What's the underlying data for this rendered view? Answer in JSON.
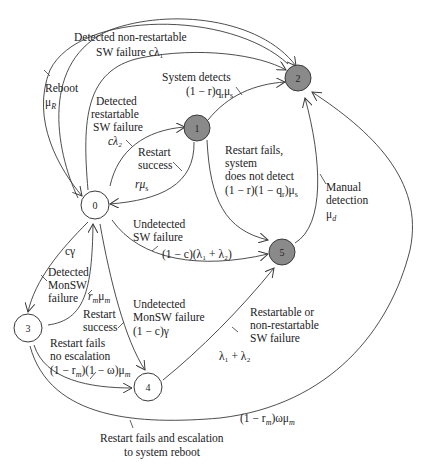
{
  "diagram": {
    "type": "state-transition-diagram",
    "colors": {
      "line": "#3a3a3a",
      "failed_state_fill": "#8a8a8a",
      "healthy_state_fill": "#ffffff",
      "text": "#222222"
    },
    "nodes": [
      {
        "id": "0",
        "label": "0",
        "style": "open"
      },
      {
        "id": "1",
        "label": "1",
        "style": "filled"
      },
      {
        "id": "2",
        "label": "2",
        "style": "filled"
      },
      {
        "id": "3",
        "label": "3",
        "style": "open"
      },
      {
        "id": "4",
        "label": "4",
        "style": "open"
      },
      {
        "id": "5",
        "label": "5",
        "style": "filled"
      }
    ],
    "edges": {
      "e0_2_nonrestart": {
        "from": "0",
        "to": "2",
        "line1": "Detected non-restartable",
        "line2": "SW failure cλ₁"
      },
      "e2_0_reboot": {
        "from": "2",
        "to": "0",
        "line1": "Reboot",
        "line2": "μ",
        "sub": "R"
      },
      "e0_1_restartable": {
        "from": "0",
        "to": "1",
        "line1": "Detected",
        "line2": "restartable",
        "line3": "SW failure",
        "line4": "cλ₂"
      },
      "e1_2_detects": {
        "from": "1",
        "to": "2",
        "line1": "System detects",
        "line2": "(1 − r)q",
        "sub2": "r",
        "tail2": "μ",
        "sub3": "s"
      },
      "e1_0_success": {
        "from": "1",
        "to": "0",
        "line1": "Restart",
        "line2": "success",
        "line3": "rμ",
        "sub": "s"
      },
      "e1_5_notdetect": {
        "from": "1",
        "to": "5",
        "line1": "Restart fails,",
        "line2": "system",
        "line3": "does not detect",
        "line4": "(1 − r)(1 − q",
        "sub4": "r",
        "tail4": ")μ",
        "sub4b": "s"
      },
      "e5_2_manual": {
        "from": "5",
        "to": "2",
        "line1": "Manual",
        "line2": "detection",
        "line3": "μ",
        "sub": "d"
      },
      "e0_5_undetected": {
        "from": "0",
        "to": "5",
        "line1": "Undetected",
        "line2": "SW failure",
        "line3": "(1 − c)(λ₁ + λ₂)"
      },
      "e0_3_monsw": {
        "from": "0",
        "to": "3",
        "line1": "cγ",
        "line2": "Detected",
        "line3": "MonSW",
        "line4": "failure"
      },
      "e3_0_success": {
        "from": "3",
        "to": "0",
        "line1": "r",
        "sub1": "m",
        "tail1": "μ",
        "sub1b": "m",
        "line2": "Restart",
        "line3": "success"
      },
      "e0_4_undetected_mon": {
        "from": "0",
        "to": "4",
        "line1": "Undetected",
        "line2": "MonSW failure",
        "line3": "(1 − c)γ"
      },
      "e3_4_noescalation": {
        "from": "3",
        "to": "4",
        "line1": "Restart fails",
        "line2": "no escalation",
        "line3": "(1 − r",
        "sub3": "m",
        "tail3": ")(1 − ω)μ",
        "sub3b": "m"
      },
      "e4_5_fail": {
        "from": "4",
        "to": "5",
        "line1": "Restartable or",
        "line2": "non-restartable",
        "line3": "SW failure",
        "line4": "λ₁ + λ₂"
      },
      "e3_2_escalation": {
        "from": "3",
        "to": "2",
        "rate": "(1 − r",
        "sub": "m",
        "tail": ")ωμ",
        "sub2": "m",
        "line1": "Restart fails and escalation",
        "line2": "to system reboot"
      }
    }
  }
}
